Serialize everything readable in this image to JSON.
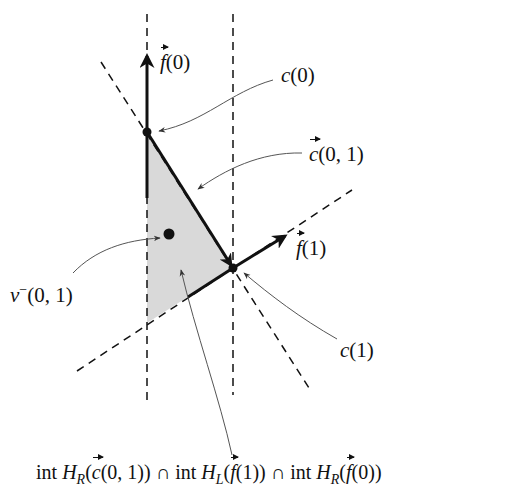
{
  "diagram": {
    "type": "geometric construction",
    "colors": {
      "stroke": "#111111",
      "shade": "#d9d9d9",
      "annotation": "#555555",
      "background": "#ffffff"
    },
    "points": {
      "c0": {
        "label": "c(0)",
        "x": 147,
        "y": 132
      },
      "c1": {
        "label": "c(1)",
        "x": 233,
        "y": 268
      },
      "v_minus": {
        "label": "v⁻(0,1)",
        "x": 169,
        "y": 234
      }
    },
    "vectors": {
      "f0": {
        "label": "f(0)",
        "from": [
          147,
          132
        ],
        "to": [
          147,
          55
        ]
      },
      "f1": {
        "label": "f(1)",
        "from": [
          233,
          268
        ],
        "to": [
          286,
          235
        ]
      },
      "c01": {
        "label": "c(0,1)",
        "from": [
          147,
          132
        ],
        "to": [
          233,
          268
        ]
      }
    },
    "dashed_lines": [
      {
        "name": "line-f0",
        "from": [
          147,
          14
        ],
        "to": [
          147,
          402
        ]
      },
      {
        "name": "line-right-vertical",
        "from": [
          233,
          14
        ],
        "to": [
          233,
          395
        ]
      },
      {
        "name": "line-c01",
        "from": [
          101,
          62
        ],
        "to": [
          309,
          388
        ]
      },
      {
        "name": "line-f1",
        "from": [
          77,
          371
        ],
        "to": [
          352,
          190
        ]
      }
    ],
    "region": {
      "label": "int H_R(c(0,1)) ∩ int H_L(f(1)) ∩ int H_R(f(0))",
      "vertices": [
        [
          147,
          132
        ],
        [
          233,
          268
        ],
        [
          147,
          323
        ]
      ]
    }
  },
  "labels": {
    "f0": {
      "vec": "f",
      "arg": "(0)"
    },
    "c0": {
      "name": "c",
      "arg": "(0)"
    },
    "c01": {
      "vec": "c",
      "arg": "(0, 1)"
    },
    "f1": {
      "vec": "f",
      "arg": "(1)"
    },
    "vminus": {
      "name": "v",
      "sup": "−",
      "arg": "(0, 1)"
    },
    "c1": {
      "name": "c",
      "arg": "(1)"
    },
    "region": {
      "part1_int": "int",
      "part1_H": "H",
      "part1_sub": "R",
      "part1_open": "(",
      "part1_vec": "c",
      "part1_arg": "(0, 1))",
      "cap1": " ∩ ",
      "part2_int": "int",
      "part2_H": "H",
      "part2_sub": "L",
      "part2_open": "(",
      "part2_vec": "f",
      "part2_arg": "(1))",
      "cap2": " ∩ ",
      "part3_int": "int",
      "part3_H": "H",
      "part3_sub": "R",
      "part3_open": "(",
      "part3_vec": "f",
      "part3_arg": "(0))"
    }
  }
}
